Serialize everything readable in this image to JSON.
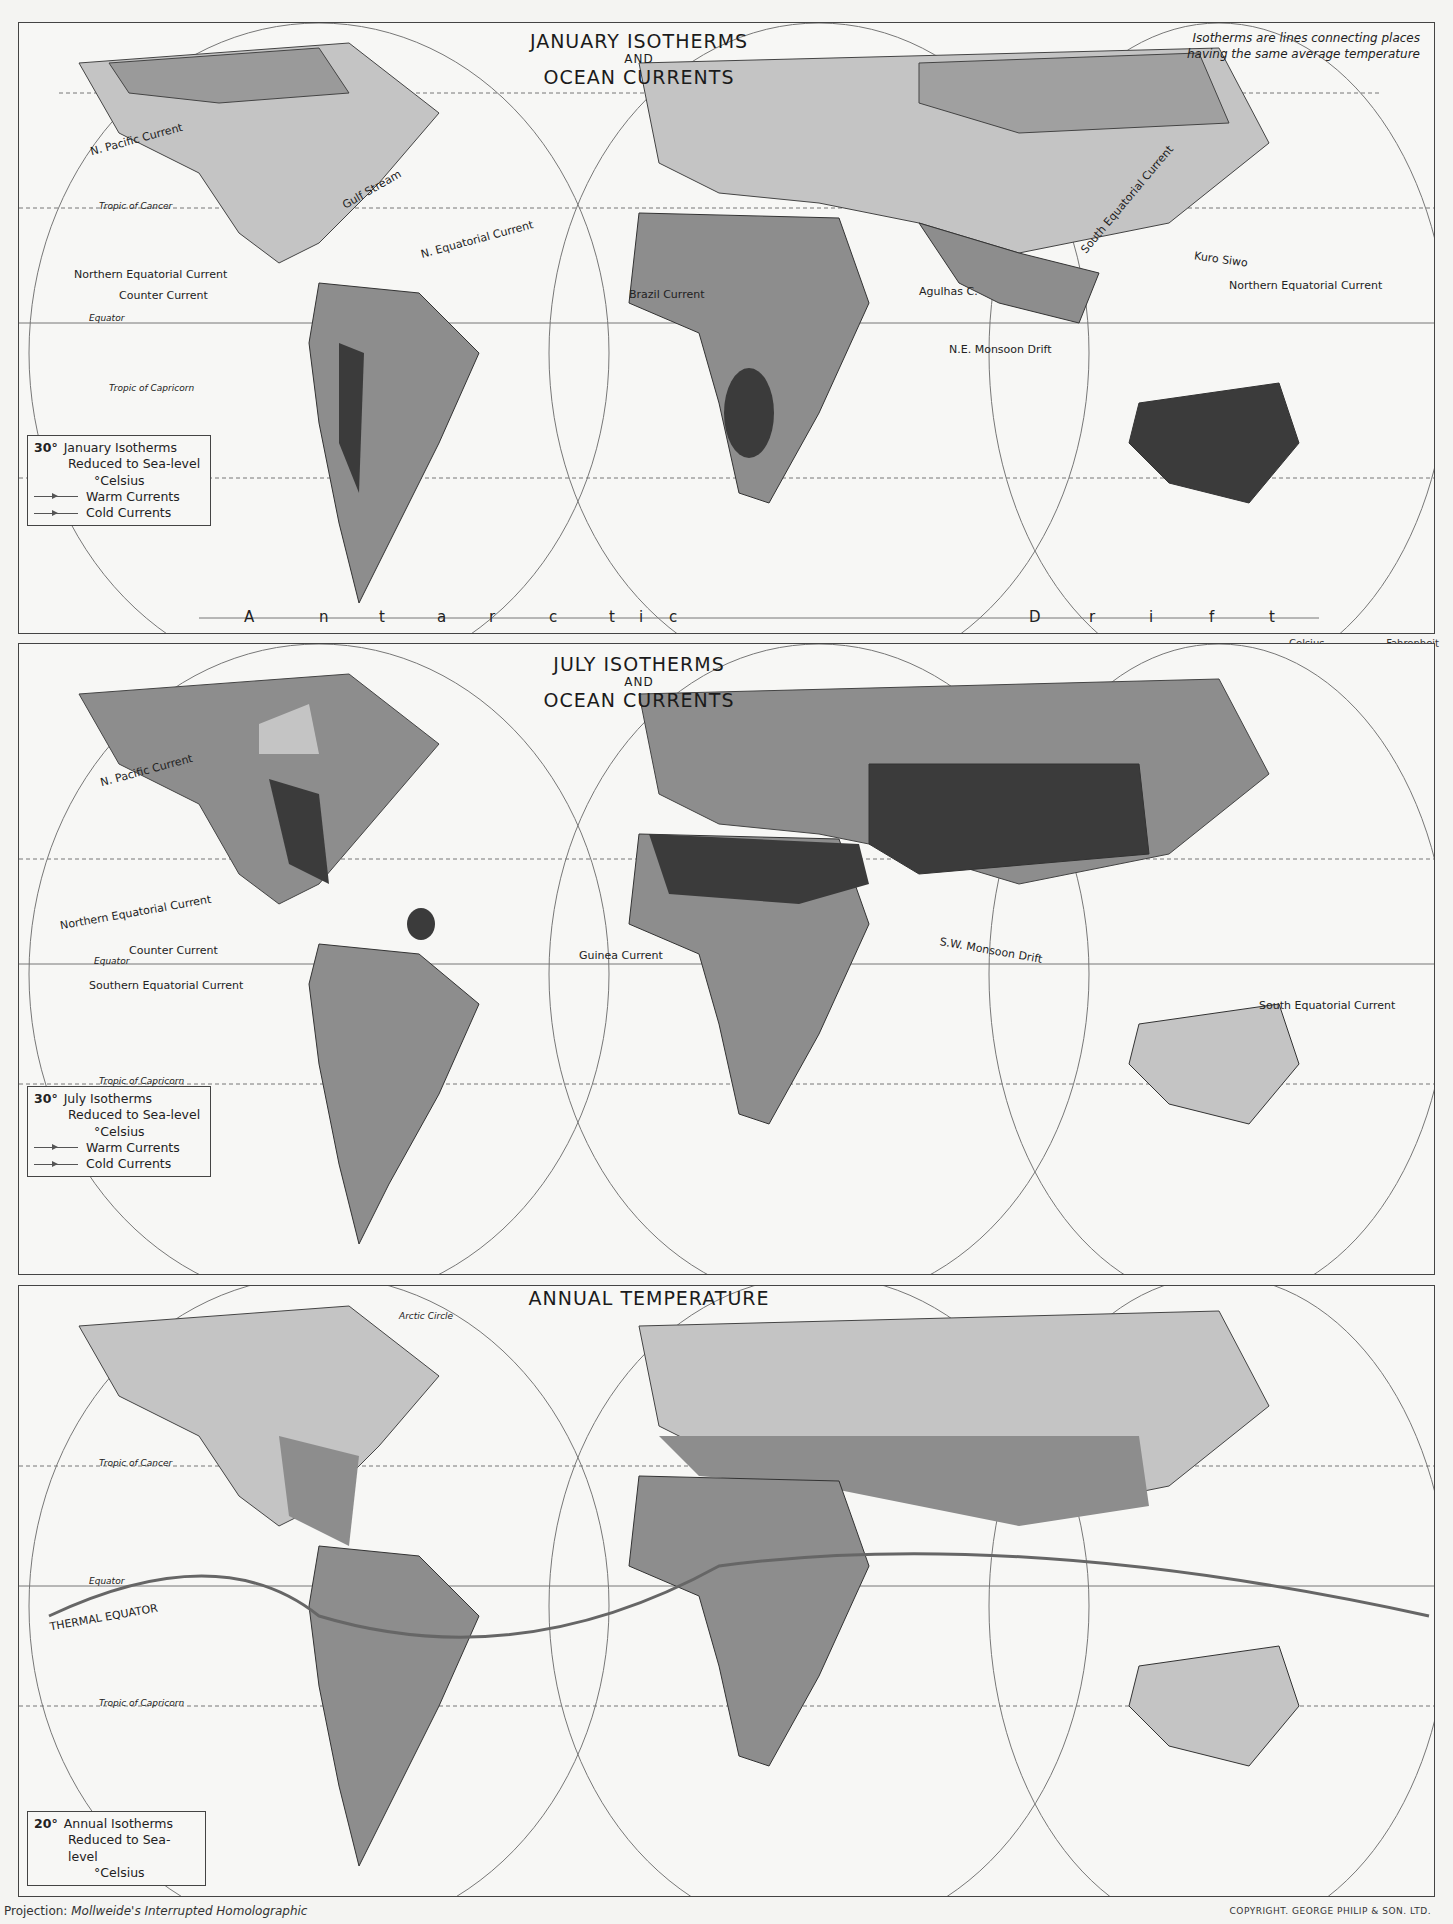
{
  "maps": [
    {
      "id": "january",
      "title_line1": "JANUARY ISOTHERMS",
      "title_and": "AND",
      "title_line2": "OCEAN CURRENTS",
      "note_line1": "Isotherms are lines connecting places",
      "note_line2": "having the same average temperature",
      "legend": {
        "degree": "30°",
        "line1": "January Isotherms",
        "line2": "Reduced to Sea-level",
        "line3": "°Celsius",
        "warm": "Warm Currents",
        "cold": "Cold Currents"
      },
      "labels": [
        "Arctic Circle",
        "Labrador C.",
        "N. Pacific Current",
        "Californian C.",
        "Gulf Stream",
        "Tropic of Cancer",
        "N. Equatorial Current",
        "Northern Equatorial Current",
        "Counter Current",
        "Equator",
        "Southern",
        "Equatorial",
        "Current",
        "Tropic of Capricorn",
        "Peruvian C.",
        "Brazil Current",
        "Guinea C.",
        "Benguela Current",
        "Agulhas C.",
        "N.E. Monsoon Drift",
        "South Equatorial Current",
        "Kuro Siwo",
        "Northern Equatorial Current",
        "Counter Current"
      ],
      "isotherms": [
        "-30°",
        "-20°",
        "-10°",
        "0°",
        "10°",
        "20°",
        "30°"
      ],
      "drift_letters": [
        "A",
        "n",
        "t",
        "a",
        "r",
        "c",
        "t",
        "i",
        "c",
        "D",
        "r",
        "i",
        "f",
        "t"
      ]
    },
    {
      "id": "july",
      "title_line1": "JULY ISOTHERMS",
      "title_and": "AND",
      "title_line2": "OCEAN CURRENTS",
      "legend": {
        "degree": "30°",
        "line1": "July Isotherms",
        "line2": "Reduced to Sea-level",
        "line3": "°Celsius",
        "warm": "Warm Currents",
        "cold": "Cold Currents"
      },
      "labels": [
        "Arctic Circle",
        "Labrador C.",
        "N. Pacific Current",
        "Californian C.",
        "Gulf Stream",
        "Tropic of Cancer",
        "N. Equatorial Current",
        "Northern Equatorial Current",
        "Counter Current",
        "Equator",
        "Southern Equatorial Current",
        "Tropic of Capricorn",
        "Peruvian C.",
        "Brazil Current",
        "Guinea Current",
        "Benguela Current",
        "Agulhas C.",
        "S.W. Monsoon Drift",
        "South Equatorial Current",
        "Kuro Siwo",
        "N. Equatorial Current",
        "Counter Current",
        "South Equatorial Current"
      ],
      "isotherms": [
        "0°",
        "10°",
        "20°",
        "30°"
      ]
    },
    {
      "id": "annual",
      "title_line1": "ANNUAL TEMPERATURE",
      "legend": {
        "degree": "20°",
        "line1": "Annual Isotherms",
        "line2": "Reduced to Sea-level",
        "line3": "°Celsius"
      },
      "labels": [
        "Arctic Circle",
        "Tropic of Cancer",
        "Equator",
        "THERMAL EQUATOR",
        "Tropic of Capricorn"
      ],
      "isotherms": [
        "-20°",
        "-10°",
        "0°",
        "10°",
        "20°",
        "25°"
      ]
    }
  ],
  "temperature_scale": {
    "celsius_header": "Celsius",
    "fahrenheit_header": "Fahrenheit",
    "freezing_label": "Freezing",
    "rows": [
      {
        "c": "30°",
        "f": "86°"
      },
      {
        "c": "20°",
        "f": "68°"
      },
      {
        "c": "10°",
        "f": "50°"
      },
      {
        "c": "0°",
        "f": "32°"
      },
      {
        "c": "-10°",
        "f": "14°"
      },
      {
        "c": "-20°",
        "f": "-4°"
      },
      {
        "c": "-30°",
        "f": "-22°"
      }
    ],
    "colors": [
      "#3a3a3a",
      "#8a8a8a",
      "#c2c2c2",
      "#f2f2f2",
      "#d6d6d6",
      "#b8b8b8",
      "#9c9c9c",
      "#8a8a8a"
    ]
  },
  "footer": {
    "projection_label": "Projection:",
    "projection_name": "Mollweide's Interrupted Homolographic",
    "copyright": "COPYRIGHT. GEORGE PHILIP & SON. LTD."
  },
  "land_colors": {
    "hot": "#3b3b3b",
    "warm": "#8d8d8d",
    "mild": "#c4c4c4",
    "cool": "#dcdcdc",
    "cold": "#a9a9a9",
    "ocean": "#f7f7f5",
    "grid": "#777777"
  }
}
